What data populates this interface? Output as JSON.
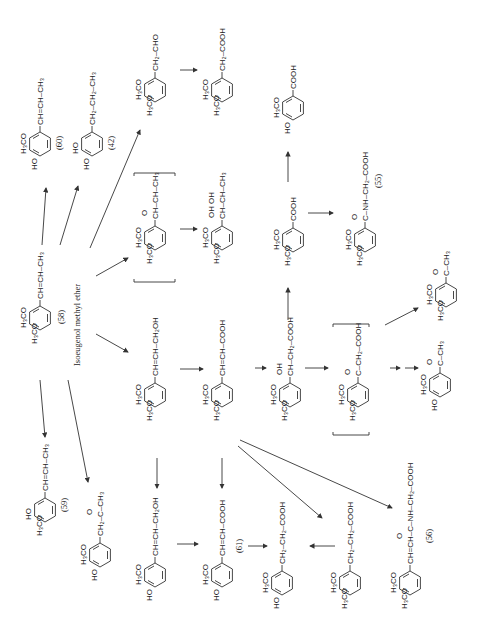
{
  "diagram": {
    "orientation": "rotated 90 degrees counter-clockwise",
    "start_compound": {
      "name": "Isoeugenol methyl ether",
      "number": "(58)"
    },
    "compounds": [
      {
        "id": "c58",
        "number": "(58)",
        "name": "Isoeugenol methyl ether",
        "sub1": "H3CO",
        "sub2": "H3CO",
        "chain": "CH=CH–CH3"
      },
      {
        "id": "c60",
        "number": "(60)",
        "sub1": "H3CO",
        "sub2": "HO",
        "chain": "CH=CH–CH3"
      },
      {
        "id": "c42",
        "number": "(42)",
        "sub1": "HO",
        "sub2": "HO",
        "chain": "CH2–CH2–CH3"
      },
      {
        "id": "c_ald",
        "number": "",
        "sub1": "H3CO",
        "sub2": "H3CO",
        "chain": "CH2–CHO"
      },
      {
        "id": "c_acid1",
        "number": "",
        "sub1": "H3CO",
        "sub2": "H3CO",
        "chain": "CH2–COOH"
      },
      {
        "id": "c_epox",
        "number": "",
        "sub1": "H3CO",
        "sub2": "H3CO",
        "chain": "CH–CH–CH3 (O epoxide)",
        "bracketed": true
      },
      {
        "id": "c_diol",
        "number": "",
        "sub1": "H3CO",
        "sub2": "H3CO",
        "chain": "CH–CH–CH3 (OH OH)"
      },
      {
        "id": "c_vanillic",
        "number": "",
        "sub1": "H3CO",
        "sub2": "HO",
        "chain": "COOH"
      },
      {
        "id": "c_veratric",
        "number": "",
        "sub1": "H3CO",
        "sub2": "H3CO",
        "chain": "COOH"
      },
      {
        "id": "c55",
        "number": "(55)",
        "sub1": "H3CO",
        "sub2": "H3CO",
        "chain": "C(=O)–NH–CH2–COOH"
      },
      {
        "id": "c_acetoveratrone",
        "number": "",
        "sub1": "H3CO",
        "sub2": "H3CO",
        "chain": "C(=O)–CH3"
      },
      {
        "id": "c_allyl_alc",
        "number": "",
        "sub1": "H3CO",
        "sub2": "H3CO",
        "chain": "CH=CH–CH2OH"
      },
      {
        "id": "c_cinnamic",
        "number": "",
        "sub1": "H3CO",
        "sub2": "H3CO",
        "chain": "CH=CH–COOH"
      },
      {
        "id": "c_hydroxy",
        "number": "",
        "sub1": "H3CO",
        "sub2": "H3CO",
        "chain": "CH(OH)–CH2–COOH"
      },
      {
        "id": "c_keto",
        "number": "",
        "sub1": "H3CO",
        "sub2": "H3CO",
        "chain": "C(=O)–CH2–COOH",
        "bracketed": true
      },
      {
        "id": "c_acetovanillone",
        "number": "",
        "sub1": "H3CO",
        "sub2": "HO",
        "chain": "C(=O)–CH3"
      },
      {
        "id": "c59",
        "number": "(59)",
        "sub1": "HO",
        "sub2": "H3CO",
        "chain": "CH=CH–CH3"
      },
      {
        "id": "c_ketone",
        "number": "",
        "sub1": "H3CO",
        "sub2": "HO",
        "chain": "CH2–C(=O)–CH3"
      },
      {
        "id": "c_coniferyl",
        "number": "",
        "sub1": "H3CO",
        "sub2": "HO",
        "chain": "CH=CH–CH2OH"
      },
      {
        "id": "c61",
        "number": "(61)",
        "sub1": "H3CO",
        "sub2": "HO",
        "chain": "CH=CH–COOH"
      },
      {
        "id": "c_dihydroferulic",
        "number": "",
        "sub1": "H3CO",
        "sub2": "HO",
        "chain": "CH2–CH2–COOH"
      },
      {
        "id": "c_dihydro_dimethoxy",
        "number": "",
        "sub1": "H3CO",
        "sub2": "H3CO",
        "chain": "CH2–CH2–COOH"
      },
      {
        "id": "c56",
        "number": "(56)",
        "sub1": "H3CO",
        "sub2": "H3CO",
        "chain": "CH=CH–C(=O)–NH–CH2–COOH"
      }
    ],
    "labels": {
      "n58": "(58)",
      "name58": "Isoeugenol methyl ether",
      "n60": "(60)",
      "n42": "(42)",
      "n55": "(55)",
      "n59": "(59)",
      "n61": "(61)",
      "n56": "(56)"
    },
    "text": {
      "H3CO": "H₃CO",
      "HO": "HO",
      "O": "O",
      "OH": "OH",
      "ch_ch_ch3": "CH=CH–CH₃",
      "ch2_ch2_ch3": "CH₂–CH₂–CH₃",
      "ch2_cho": "CH₂–CHO",
      "ch2_cooh": "CH₂–COOH",
      "ch_ch_ch3_sat": "CH–CH–CH₃",
      "cooh": "COOH",
      "c_nh_ch2_cooh": "C–NH–CH₂–COOH",
      "c_ch3": "C–CH₃",
      "ch_ch_ch2oh": "CH=CH–CH₂OH",
      "ch_ch_cooh": "CH=CH–COOH",
      "ch_ch2_cooh": "CH–CH₂–COOH",
      "c_ch2_cooh": "C–CH₂–COOH",
      "ch2_c_ch3": "CH₂–C–CH₃",
      "ch2_ch2_cooh": "CH₂–CH₂–COOH",
      "ch_ch_c_nh": "CH=CH–C–NH–CH₂–COOH"
    }
  }
}
